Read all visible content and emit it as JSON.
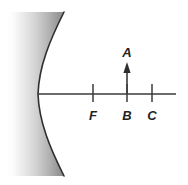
{
  "figure": {
    "kind": "optics-ray-diagram",
    "background_color": "#ffffff",
    "line_color": "#3a3a3a",
    "label_color": "#231f20",
    "mirror": {
      "type": "concave-mirror",
      "fill_gradient_from": "#fdfdfd",
      "fill_gradient_to": "#8b8b8b",
      "edge_color": "#2f2f2f"
    }
  },
  "axis": {
    "name": "principal-axis",
    "y": 94,
    "x_start": 38,
    "x_end": 176
  },
  "points": [
    {
      "id": "F",
      "label": "F",
      "x": 93,
      "label_x": 93,
      "label_y": 118,
      "tick_top": 84,
      "tick_bottom": 102
    },
    {
      "id": "B",
      "label": "B",
      "x": 127,
      "label_x": 127,
      "label_y": 118,
      "tick_top": 84,
      "tick_bottom": 102
    },
    {
      "id": "C",
      "label": "C",
      "x": 152,
      "label_x": 152,
      "label_y": 118,
      "tick_top": 84,
      "tick_bottom": 102
    }
  ],
  "object": {
    "label": "A",
    "label_x": 127,
    "label_y": 57,
    "base_x": 127,
    "base_y": 94,
    "tip_x": 127,
    "tip_y": 64,
    "direction": "up"
  }
}
